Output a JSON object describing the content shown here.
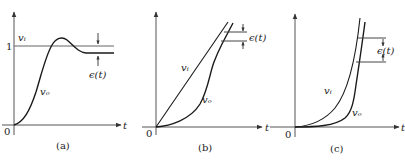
{
  "figure": {
    "panels": [
      {
        "id": "a",
        "caption": "(a)",
        "origin_label": "0",
        "x_axis_label": "t",
        "level_label": "1",
        "input_label": "vᵢ",
        "output_label": "vₒ",
        "error_label": "ϵ(t)",
        "description": "Step input; output overshoots then settles with steady-state error"
      },
      {
        "id": "b",
        "caption": "(b)",
        "origin_label": "0",
        "x_axis_label": "t",
        "input_label": "vᵢ",
        "output_label": "vₒ",
        "error_label": "ϵ(t)",
        "description": "Ramp input; output lags with constant error"
      },
      {
        "id": "c",
        "caption": "(c)",
        "origin_label": "0",
        "x_axis_label": "t",
        "input_label": "vᵢ",
        "output_label": "vₒ",
        "error_label": "ϵ(t)",
        "description": "Parabolic input; output lags with error"
      }
    ],
    "colors": {
      "axis": "#555555",
      "curve": "#1a1a1a",
      "background": "#ffffff"
    }
  }
}
